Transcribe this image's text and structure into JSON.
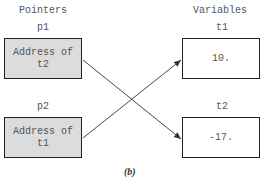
{
  "headers": {
    "left": "Pointers",
    "right": "Variables"
  },
  "pointers": [
    {
      "name": "p1",
      "content_line1": "Address of",
      "content_line2": "t2",
      "points_to": "t2"
    },
    {
      "name": "p2",
      "content_line1": "Address of",
      "content_line2": "t1",
      "points_to": "t1"
    }
  ],
  "variables": [
    {
      "name": "t1",
      "value": "10."
    },
    {
      "name": "t2",
      "value": "-17."
    }
  ],
  "caption": "(b)",
  "colors": {
    "pointer_fill": "#dcdcdc",
    "variable_fill": "#ffffff",
    "border": "#222222",
    "arrow": "#333333",
    "text": "#555555"
  }
}
